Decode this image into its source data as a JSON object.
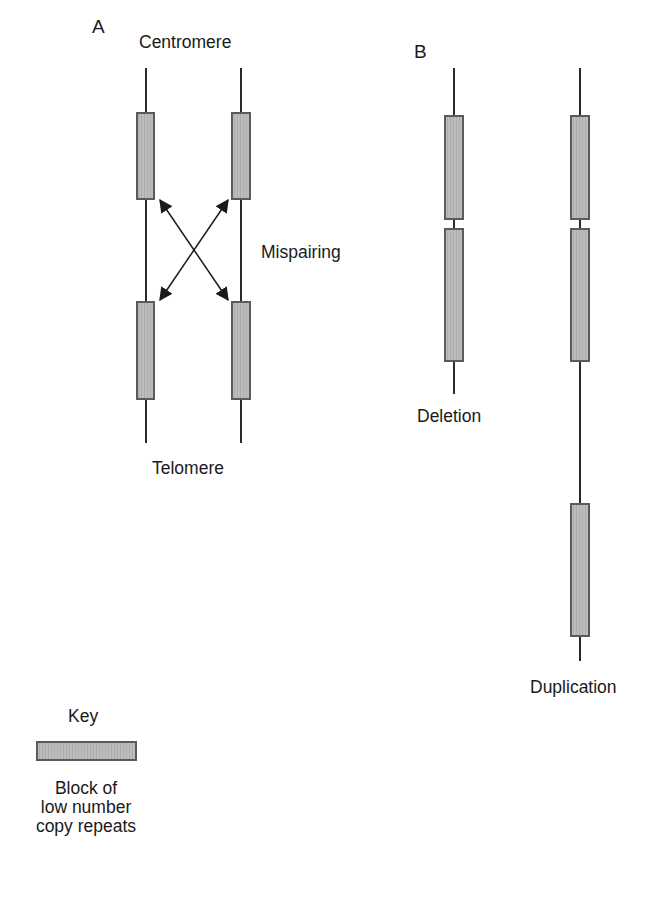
{
  "panel_a": {
    "label": "A",
    "top_label": "Centromere",
    "middle_label": "Mispairing",
    "bottom_label": "Telomere"
  },
  "panel_b": {
    "label": "B",
    "left_label": "Deletion",
    "right_label": "Duplication"
  },
  "key": {
    "title": "Key",
    "line1": "Block of",
    "line2": "low number",
    "line3": "copy repeats"
  },
  "colors": {
    "block_fill": "#b8b8b8",
    "block_stroke": "#5a5a5a",
    "line": "#2a2a2a"
  }
}
